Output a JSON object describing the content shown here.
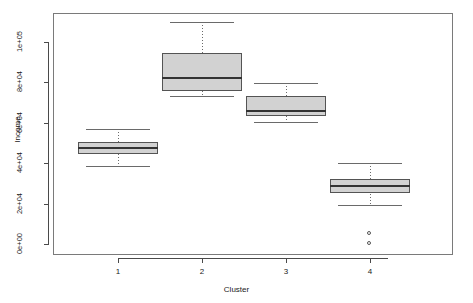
{
  "chart_data": {
    "type": "box",
    "title": "",
    "xlabel": "Cluster",
    "ylabel": "Income",
    "categories": [
      "1",
      "2",
      "3",
      "4"
    ],
    "ytick_labels": [
      "0e+00",
      "2e+04",
      "4e+04",
      "6e+04",
      "8e+04",
      "1e+05"
    ],
    "ytick_values": [
      0,
      20000,
      40000,
      60000,
      80000,
      100000
    ],
    "ylim": [
      -3000,
      110000
    ],
    "grid": false,
    "legend": null,
    "box_fill_color": "#d2d2d2",
    "box_border_color": "#545454",
    "median_color": "#333333",
    "boxes": [
      {
        "category": "1",
        "whisker_low": 38500,
        "q1": 44500,
        "median": 47500,
        "q3": 50500,
        "whisker_high": 57000,
        "outliers": []
      },
      {
        "category": "2",
        "whisker_low": 73500,
        "q1": 75500,
        "median": 82000,
        "q3": 94500,
        "whisker_high": 110000,
        "outliers": []
      },
      {
        "category": "3",
        "whisker_low": 60500,
        "q1": 63500,
        "median": 66000,
        "q3": 73500,
        "whisker_high": 79500,
        "outliers": []
      },
      {
        "category": "4",
        "whisker_low": 19500,
        "q1": 25000,
        "median": 28500,
        "q3": 32000,
        "whisker_high": 40000,
        "outliers": [
          5000,
          0
        ]
      }
    ]
  }
}
